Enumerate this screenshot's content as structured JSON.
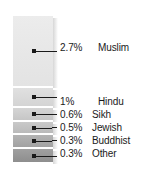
{
  "chart_data": {
    "type": "bar",
    "title": "",
    "subtitle": "",
    "xlabel": "",
    "ylabel": "",
    "orientation": "vertical-stacked",
    "grid": false,
    "legend_position": "right-callouts",
    "categories": [
      "Muslim",
      "Hindu",
      "Sikh",
      "Jewish",
      "Buddhist",
      "Other"
    ],
    "values": [
      2.7,
      1,
      0.6,
      0.5,
      0.3,
      0.3
    ],
    "value_labels": [
      "2.7%",
      "1%",
      "0.6%",
      "0.5%",
      "0.3%",
      "0.3%"
    ],
    "units": "percent",
    "segments": [
      {
        "name": "Muslim",
        "pct_label": "2.7%",
        "value": 2.7,
        "color": "#ececec",
        "color_bottom": "#e3e3e3",
        "top": 0,
        "height": 70,
        "connector": "straight",
        "label_top": 41
      },
      {
        "name": "Hindu",
        "pct_label": "1%",
        "value": 1,
        "color": "#e0e0e0",
        "color_bottom": "#d4d4d4",
        "top": 72,
        "height": 18,
        "connector": "straight",
        "label_top": 95
      },
      {
        "name": "Sikh",
        "pct_label": "0.6%",
        "value": 0.6,
        "color": "#d5d5d5",
        "color_bottom": "#c6c6c6",
        "top": 92,
        "height": 12,
        "connector": "elbow",
        "label_top": 108
      },
      {
        "name": "Jewish",
        "pct_label": "0.5%",
        "value": 0.5,
        "color": "#c9c9c9",
        "color_bottom": "#bababa",
        "top": 106,
        "height": 11,
        "connector": "elbow",
        "label_top": 121
      },
      {
        "name": "Buddhist",
        "pct_label": "0.3%",
        "value": 0.3,
        "color": "#b4b4b4",
        "color_bottom": "#a2a2a2",
        "top": 119,
        "height": 12,
        "connector": "elbow",
        "label_top": 134
      },
      {
        "name": "Other",
        "pct_label": "0.3%",
        "value": 0.3,
        "color": "#a0a0a0",
        "color_bottom": "#8e8e8e",
        "top": 133,
        "height": 13,
        "connector": "straight",
        "label_top": 147
      }
    ],
    "colors": {
      "background": "#ffffff",
      "text": "#1a1a1a",
      "leader": "#1a1a1a",
      "shadow": "rgba(120,120,120,0.30)"
    }
  }
}
